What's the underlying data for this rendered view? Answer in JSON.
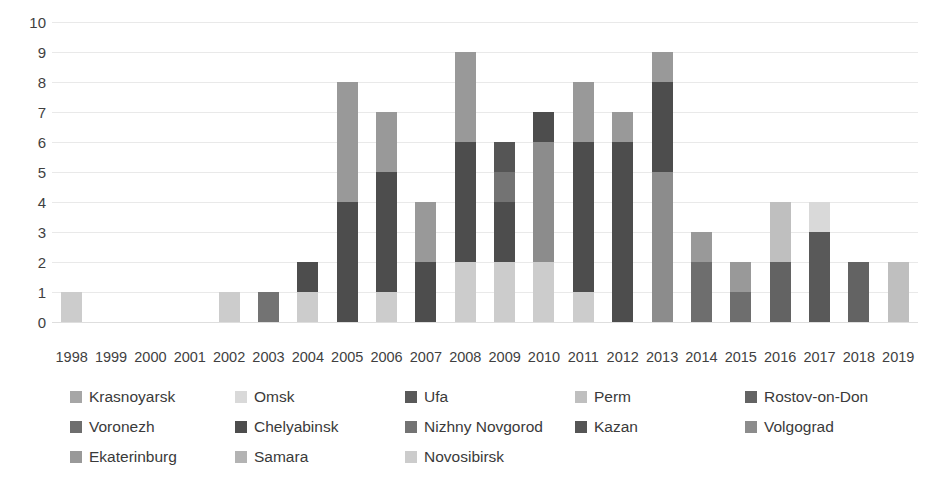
{
  "chart_data": {
    "type": "bar",
    "stacked": true,
    "title": "",
    "subtitle": "",
    "xlabel": "",
    "ylabel": "",
    "ylim": [
      0,
      10
    ],
    "ytick_values": [
      10,
      9,
      8,
      7,
      6,
      5,
      4,
      3,
      2,
      1,
      0
    ],
    "yticks": [
      "10",
      "9",
      "8",
      "7",
      "6",
      "5",
      "4",
      "3",
      "2",
      "1",
      "0"
    ],
    "grid": true,
    "grid_axis": "y",
    "legend_position": "bottom",
    "categories": [
      "1998",
      "1999",
      "2000",
      "2001",
      "2002",
      "2003",
      "2004",
      "2005",
      "2006",
      "2007",
      "2008",
      "2009",
      "2010",
      "2011",
      "2012",
      "2013",
      "2014",
      "2015",
      "2016",
      "2017",
      "2018",
      "2019"
    ],
    "series": [
      {
        "name": "Krasnoyarsk",
        "color": "#a6a6a6",
        "values": [
          0,
          0,
          0,
          0,
          0,
          0,
          0,
          0,
          0,
          0,
          0,
          0,
          0,
          0,
          0,
          0,
          0,
          0,
          0,
          0,
          0,
          0
        ]
      },
      {
        "name": "Omsk",
        "color": "#d9d9d9",
        "values": [
          0,
          0,
          0,
          0,
          0,
          0,
          0,
          0,
          0,
          0,
          0,
          0,
          0,
          0,
          0,
          0,
          0,
          0,
          0,
          1,
          0,
          0
        ]
      },
      {
        "name": "Ufa",
        "color": "#595959",
        "values": [
          0,
          0,
          0,
          0,
          0,
          0,
          0,
          0,
          0,
          0,
          0,
          0,
          0,
          0,
          0,
          0,
          0,
          0,
          0,
          3,
          0,
          0
        ]
      },
      {
        "name": "Perm",
        "color": "#bfbfbf",
        "values": [
          0,
          0,
          0,
          0,
          0,
          0,
          0,
          0,
          0,
          0,
          0,
          0,
          0,
          0,
          0,
          0,
          0,
          0,
          2,
          0,
          0,
          2
        ]
      },
      {
        "name": "Rostov-on-Don",
        "color": "#636363",
        "values": [
          0,
          0,
          0,
          0,
          0,
          0,
          0,
          0,
          0,
          0,
          0,
          0,
          0,
          0,
          0,
          0,
          0,
          0,
          2,
          0,
          2,
          0
        ]
      },
      {
        "name": "Voronezh",
        "color": "#6e6e6e",
        "values": [
          0,
          0,
          0,
          0,
          0,
          0,
          0,
          0,
          0,
          0,
          0,
          0,
          0,
          0,
          0,
          0,
          2,
          1,
          0,
          0,
          0,
          0
        ]
      },
      {
        "name": "Chelyabinsk",
        "color": "#4d4d4d",
        "values": [
          0,
          0,
          0,
          0,
          0,
          0,
          1,
          4,
          4,
          2,
          4,
          2,
          1,
          5,
          6,
          3,
          0,
          0,
          0,
          0,
          0,
          0
        ]
      },
      {
        "name": "Nizhny Novgorod",
        "color": "#737373",
        "values": [
          0,
          0,
          0,
          0,
          0,
          1,
          0,
          0,
          0,
          0,
          0,
          1,
          0,
          0,
          0,
          0,
          0,
          0,
          0,
          0,
          0,
          0
        ]
      },
      {
        "name": "Kazan",
        "color": "#555555",
        "values": [
          0,
          0,
          0,
          0,
          0,
          0,
          0,
          0,
          0,
          0,
          0,
          1,
          0,
          0,
          0,
          0,
          0,
          0,
          0,
          0,
          0,
          0
        ]
      },
      {
        "name": "Volgograd",
        "color": "#8c8c8c",
        "values": [
          0,
          0,
          0,
          0,
          0,
          0,
          0,
          0,
          0,
          0,
          0,
          0,
          4,
          0,
          0,
          5,
          0,
          0,
          0,
          0,
          0,
          0
        ]
      },
      {
        "name": "Ekaterinburg",
        "color": "#999999",
        "values": [
          0,
          0,
          0,
          0,
          0,
          0,
          0,
          4,
          2,
          2,
          3,
          0,
          0,
          2,
          1,
          1,
          1,
          1,
          0,
          0,
          0,
          0
        ]
      },
      {
        "name": "Samara",
        "color": "#b3b3b3",
        "values": [
          0,
          0,
          0,
          0,
          0,
          0,
          0,
          0,
          0,
          0,
          0,
          0,
          0,
          0,
          0,
          0,
          0,
          0,
          0,
          0,
          0,
          0
        ]
      },
      {
        "name": "Novosibirsk",
        "color": "#cccccc",
        "values": [
          1,
          0,
          0,
          0,
          1,
          0,
          1,
          0,
          1,
          0,
          2,
          2,
          2,
          1,
          0,
          0,
          0,
          0,
          0,
          0,
          0,
          0
        ]
      }
    ],
    "stack_order_bottom_to_top": [
      "Novosibirsk",
      "Volgograd",
      "Chelyabinsk",
      "Nizhny Novgorod",
      "Kazan",
      "Rostov-on-Don",
      "Voronezh",
      "Ufa",
      "Ekaterinburg",
      "Perm",
      "Omsk",
      "Samara",
      "Krasnoyarsk"
    ],
    "totals": [
      1,
      0,
      0,
      0,
      1,
      1,
      2,
      8,
      7,
      4,
      9,
      7,
      7,
      8,
      7,
      9,
      3,
      2,
      4,
      4,
      2,
      2
    ]
  },
  "legend": {
    "rows": [
      [
        {
          "label": "Krasnoyarsk",
          "color": "#a6a6a6",
          "width": 165
        },
        {
          "label": "Omsk",
          "color": "#d9d9d9",
          "width": 170
        },
        {
          "label": "Ufa",
          "color": "#595959",
          "width": 170
        },
        {
          "label": "Perm",
          "color": "#bfbfbf",
          "width": 170
        },
        {
          "label": "Rostov-on-Don",
          "color": "#636363",
          "width": 175
        }
      ],
      [
        {
          "label": "Voronezh",
          "color": "#6e6e6e",
          "width": 165
        },
        {
          "label": "Chelyabinsk",
          "color": "#4d4d4d",
          "width": 170
        },
        {
          "label": "Nizhny Novgorod",
          "color": "#737373",
          "width": 170
        },
        {
          "label": "Kazan",
          "color": "#555555",
          "width": 170
        },
        {
          "label": "Volgograd",
          "color": "#8c8c8c",
          "width": 175
        }
      ],
      [
        {
          "label": "Ekaterinburg",
          "color": "#999999",
          "width": 165
        },
        {
          "label": "Samara",
          "color": "#b3b3b3",
          "width": 170
        },
        {
          "label": "Novosibirsk",
          "color": "#cccccc",
          "width": 170
        }
      ]
    ]
  }
}
